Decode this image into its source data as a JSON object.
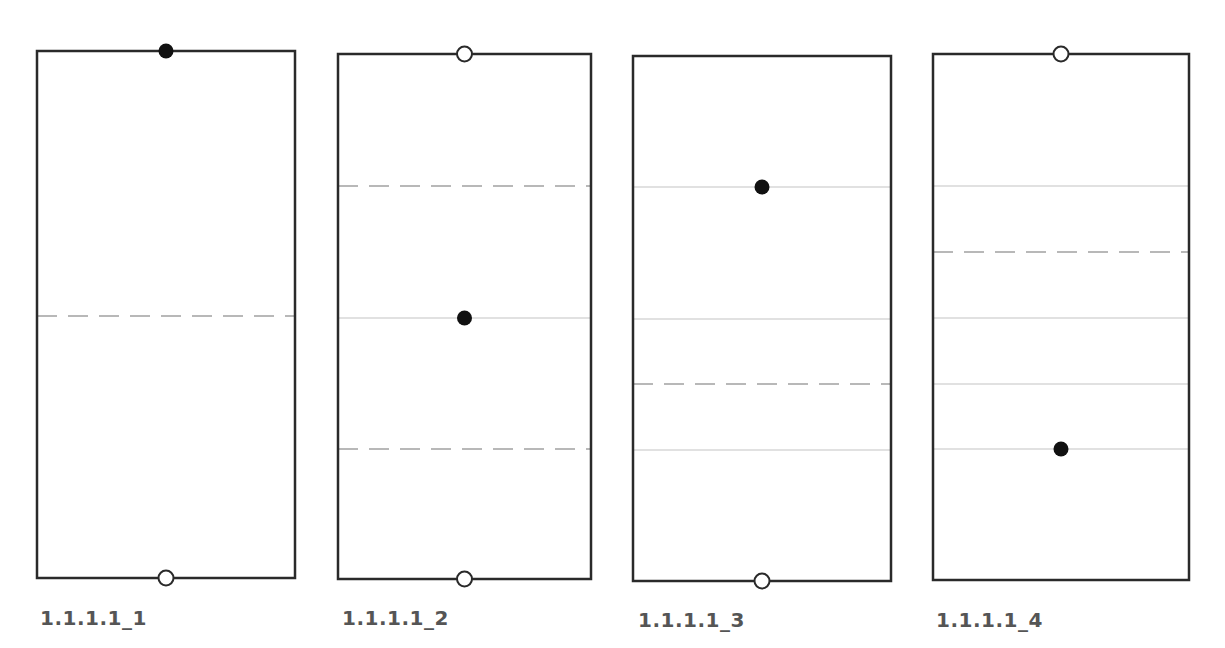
{
  "colors": {
    "frame": "#2a2a2a",
    "solid_line": "#c4c4c4",
    "dashed_line": "#b8b8b8",
    "dot": "#111111",
    "label": "#555555",
    "background": "#ffffff"
  },
  "panels": [
    {
      "label": "1.1.1.1_1",
      "rect": {
        "x": 37,
        "y": 51,
        "w": 258,
        "h": 527
      },
      "label_pos": {
        "x": 40,
        "y": 624
      },
      "top_marker": "filled",
      "bottom_marker": "hollow",
      "solid_lines": [],
      "dashed_lines": [
        316
      ],
      "inner_dot_y": null
    },
    {
      "label": "1.1.1.1_2",
      "rect": {
        "x": 338,
        "y": 54,
        "w": 253,
        "h": 525
      },
      "label_pos": {
        "x": 342,
        "y": 624
      },
      "top_marker": "hollow",
      "bottom_marker": "hollow",
      "solid_lines": [
        318
      ],
      "dashed_lines": [
        186,
        449
      ],
      "inner_dot_y": 318
    },
    {
      "label": "1.1.1.1_3",
      "rect": {
        "x": 633,
        "y": 56,
        "w": 258,
        "h": 525
      },
      "label_pos": {
        "x": 638,
        "y": 626
      },
      "top_marker": "none",
      "bottom_marker": "hollow",
      "solid_lines": [
        187,
        319,
        450
      ],
      "dashed_lines": [
        384
      ],
      "inner_dot_y": 187
    },
    {
      "label": "1.1.1.1_4",
      "rect": {
        "x": 933,
        "y": 54,
        "w": 256,
        "h": 526
      },
      "label_pos": {
        "x": 936,
        "y": 626
      },
      "top_marker": "hollow",
      "bottom_marker": "none",
      "solid_lines": [
        186,
        318,
        384,
        449
      ],
      "dashed_lines": [
        252
      ],
      "inner_dot_y": 449
    }
  ]
}
